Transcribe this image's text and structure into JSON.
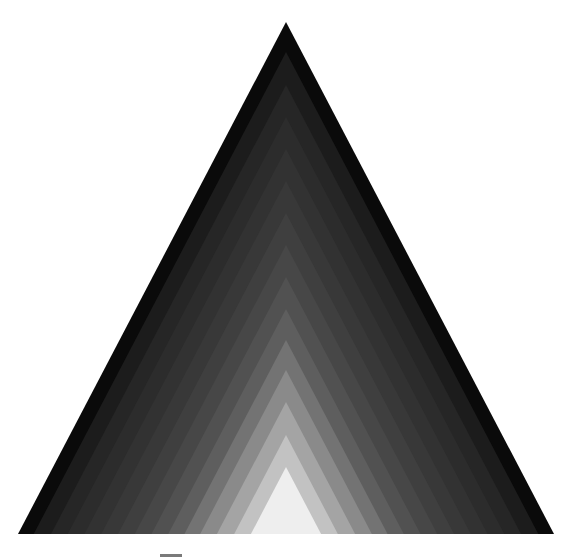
{
  "figure": {
    "outer_triangle": {
      "apex": [
        286,
        22
      ],
      "base_left": [
        17,
        534
      ],
      "base_right": [
        553,
        534
      ]
    },
    "bands": [
      {
        "apex_y": 22,
        "color": "#0a0a0a"
      },
      {
        "apex_y": 52,
        "color": "#1c1c1c"
      },
      {
        "apex_y": 85,
        "color": "#262626"
      },
      {
        "apex_y": 117,
        "color": "#2c2c2c"
      },
      {
        "apex_y": 149,
        "color": "#323232"
      },
      {
        "apex_y": 181,
        "color": "#383838"
      },
      {
        "apex_y": 213,
        "color": "#3f3f3f"
      },
      {
        "apex_y": 245,
        "color": "#474747"
      },
      {
        "apex_y": 277,
        "color": "#515151"
      },
      {
        "apex_y": 309,
        "color": "#5e5e5e"
      },
      {
        "apex_y": 340,
        "color": "#737373"
      },
      {
        "apex_y": 370,
        "color": "#8a8a8a"
      },
      {
        "apex_y": 402,
        "color": "#a4a4a4"
      },
      {
        "apex_y": 435,
        "color": "#c2c2c2"
      },
      {
        "apex_y": 467,
        "color": "#eeeeee"
      }
    ]
  }
}
